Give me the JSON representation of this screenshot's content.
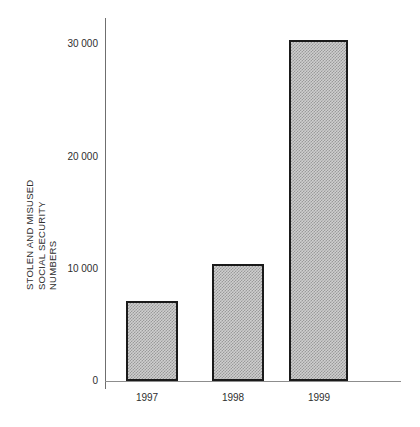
{
  "chart_data": {
    "type": "bar",
    "title": "",
    "subtitle": "",
    "xlabel": "",
    "ylabel": "STOLEN AND MISUSED SOCIAL SECURITY NUMBERS",
    "ylabel_lines": [
      "STOLEN AND MISUSED",
      "SOCIAL SECURITY",
      "NUMBERS"
    ],
    "categories": [
      "1997",
      "1998",
      "1999"
    ],
    "values": [
      7200,
      10500,
      30500
    ],
    "series": [
      {
        "name": "Stolen and misused Social Security numbers",
        "values": [
          7200,
          10500,
          30500
        ]
      }
    ],
    "ylim": [
      0,
      32500
    ],
    "yticks": [
      0,
      10000,
      20000,
      30000
    ],
    "ytick_labels": [
      "0",
      "10 000",
      "20 000",
      "30 000"
    ],
    "grid": false,
    "legend": false,
    "legend_position": "none",
    "annotations": [],
    "bar_fill": "#cfcfcf",
    "bar_hatch_color": "#9a9a9a",
    "bar_edge_color": "#1a1a1a",
    "axis_color": "#6f6f6f",
    "text_color": "#2e2e2e",
    "background": "#ffffff"
  }
}
